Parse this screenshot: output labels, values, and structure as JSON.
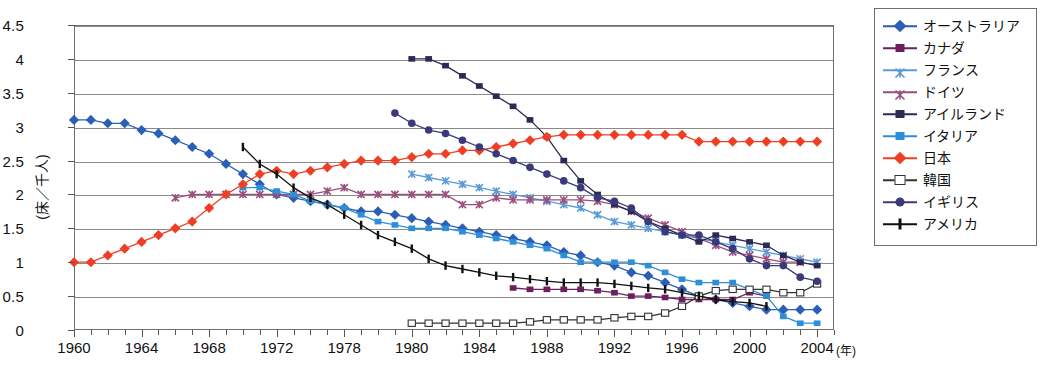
{
  "chart_data": {
    "type": "line",
    "title": "",
    "xlabel": "(年)",
    "ylabel": "(床／千人)",
    "xlim": [
      1960,
      2005
    ],
    "ylim": [
      0,
      4.5
    ],
    "ytick_values": [
      0,
      0.5,
      1,
      1.5,
      2,
      2.5,
      3,
      3.5,
      4,
      4.5
    ],
    "ytick_labels": [
      "0",
      "0.5",
      "1",
      "1.5",
      "2",
      "2.5",
      "3",
      "3.5",
      "4",
      "4.5"
    ],
    "xtick_values": [
      1960,
      1964,
      1968,
      1972,
      1976,
      1980,
      1984,
      1988,
      1992,
      1996,
      2000,
      2004
    ],
    "xtick_labels": [
      "1960",
      "1964",
      "1968",
      "1972",
      "1978",
      "1980",
      "1984",
      "1988",
      "1992",
      "1996",
      "2000",
      "2004"
    ],
    "grid": true,
    "legend_position": "right",
    "series": [
      {
        "name": "オーストラリア",
        "color": "#2a5fb5",
        "marker": "diamond",
        "x": [
          1960,
          1961,
          1962,
          1963,
          1964,
          1965,
          1966,
          1967,
          1968,
          1969,
          1970,
          1971,
          1972,
          1973,
          1974,
          1975,
          1976,
          1977,
          1978,
          1979,
          1980,
          1981,
          1982,
          1983,
          1984,
          1985,
          1986,
          1987,
          1988,
          1989,
          1990,
          1991,
          1992,
          1993,
          1994,
          1995,
          1996,
          1997,
          1998,
          1999,
          2000,
          2001,
          2002,
          2003,
          2004
        ],
        "y": [
          3.1,
          3.1,
          3.05,
          3.05,
          2.95,
          2.9,
          2.8,
          2.7,
          2.6,
          2.45,
          2.3,
          2.15,
          2.0,
          1.95,
          1.9,
          1.85,
          1.8,
          1.75,
          1.75,
          1.7,
          1.65,
          1.6,
          1.55,
          1.5,
          1.45,
          1.4,
          1.35,
          1.3,
          1.25,
          1.15,
          1.1,
          1.0,
          0.95,
          0.85,
          0.8,
          0.7,
          0.6,
          0.5,
          0.45,
          0.4,
          0.35,
          0.3,
          0.3,
          0.3,
          0.3
        ]
      },
      {
        "name": "カナダ",
        "color": "#6d2060",
        "marker": "square",
        "x": [
          1986,
          1987,
          1988,
          1989,
          1990,
          1991,
          1992,
          1993,
          1994,
          1995,
          1996,
          1997,
          1998,
          1999,
          2000,
          2001
        ],
        "y": [
          0.62,
          0.6,
          0.6,
          0.6,
          0.6,
          0.58,
          0.55,
          0.5,
          0.5,
          0.48,
          0.45,
          0.45,
          0.45,
          0.45,
          0.55,
          0.5
        ]
      },
      {
        "name": "フランス",
        "color": "#5b9bd5",
        "marker": "x",
        "x": [
          1980,
          1981,
          1982,
          1983,
          1984,
          1985,
          1986,
          1987,
          1988,
          1989,
          1990,
          1991,
          1992,
          1993,
          1994,
          1995,
          1996,
          1997,
          1998,
          1999,
          2000,
          2001,
          2002,
          2003,
          2004
        ],
        "y": [
          2.3,
          2.25,
          2.2,
          2.15,
          2.1,
          2.05,
          2.0,
          1.95,
          1.9,
          1.85,
          1.8,
          1.7,
          1.6,
          1.55,
          1.5,
          1.45,
          1.4,
          1.35,
          1.3,
          1.25,
          1.2,
          1.15,
          1.1,
          1.05,
          1.0
        ]
      },
      {
        "name": "ドイツ",
        "color": "#9b4f7c",
        "marker": "x",
        "x": [
          1966,
          1967,
          1968,
          1969,
          1970,
          1971,
          1972,
          1973,
          1974,
          1975,
          1976,
          1977,
          1978,
          1979,
          1980,
          1981,
          1982,
          1983,
          1984,
          1985,
          1986,
          1987,
          1988,
          1989,
          1990,
          1991,
          1992,
          1993,
          1994,
          1995,
          1996,
          1997,
          1998,
          1999,
          2000,
          2001,
          2002,
          2003
        ],
        "y": [
          1.95,
          2.0,
          2.0,
          2.0,
          2.0,
          2.0,
          2.0,
          2.0,
          2.0,
          2.05,
          2.1,
          2.0,
          2.0,
          2.0,
          2.0,
          2.0,
          2.0,
          1.85,
          1.85,
          1.95,
          1.92,
          1.92,
          1.92,
          1.92,
          1.92,
          1.9,
          1.85,
          1.75,
          1.65,
          1.55,
          1.45,
          1.35,
          1.25,
          1.15,
          1.1,
          1.05,
          1.0,
          1.0
        ]
      },
      {
        "name": "アイルランド",
        "color": "#2b2a55",
        "marker": "square",
        "x": [
          1980,
          1981,
          1982,
          1983,
          1984,
          1985,
          1986,
          1987,
          1988,
          1989,
          1990,
          1991,
          1992,
          1993,
          1994,
          1995,
          1996,
          1997,
          1998,
          1999,
          2000,
          2001,
          2002,
          2003,
          2004
        ],
        "y": [
          4.0,
          4.0,
          3.9,
          3.75,
          3.6,
          3.45,
          3.3,
          3.1,
          2.85,
          2.5,
          2.2,
          2.0,
          1.85,
          1.75,
          1.6,
          1.5,
          1.4,
          1.3,
          1.4,
          1.35,
          1.3,
          1.25,
          1.1,
          1.0,
          0.95
        ]
      },
      {
        "name": "イタリア",
        "color": "#2e8fd8",
        "marker": "square",
        "x": [
          1970,
          1971,
          1972,
          1973,
          1974,
          1975,
          1976,
          1977,
          1978,
          1979,
          1980,
          1981,
          1982,
          1983,
          1984,
          1985,
          1986,
          1987,
          1988,
          1989,
          1990,
          1991,
          1992,
          1993,
          1994,
          1995,
          1996,
          1997,
          1998,
          1999,
          2000,
          2001,
          2002,
          2003,
          2004
        ],
        "y": [
          2.1,
          2.1,
          2.05,
          2.0,
          1.9,
          1.85,
          1.8,
          1.7,
          1.6,
          1.55,
          1.5,
          1.5,
          1.5,
          1.45,
          1.4,
          1.35,
          1.3,
          1.25,
          1.2,
          1.1,
          1.0,
          1.0,
          1.0,
          1.0,
          0.95,
          0.85,
          0.75,
          0.7,
          0.7,
          0.7,
          0.6,
          0.5,
          0.2,
          0.1,
          0.1
        ]
      },
      {
        "name": "日本",
        "color": "#ef3e23",
        "marker": "diamond",
        "x": [
          1960,
          1961,
          1962,
          1963,
          1964,
          1965,
          1966,
          1967,
          1968,
          1969,
          1970,
          1971,
          1972,
          1973,
          1974,
          1975,
          1976,
          1977,
          1978,
          1979,
          1980,
          1981,
          1982,
          1983,
          1984,
          1985,
          1986,
          1987,
          1988,
          1989,
          1990,
          1991,
          1992,
          1993,
          1994,
          1995,
          1996,
          1997,
          1998,
          1999,
          2000,
          2001,
          2002,
          2003,
          2004
        ],
        "y": [
          1.0,
          1.0,
          1.1,
          1.2,
          1.3,
          1.4,
          1.5,
          1.6,
          1.8,
          2.0,
          2.15,
          2.3,
          2.35,
          2.3,
          2.35,
          2.4,
          2.45,
          2.5,
          2.5,
          2.5,
          2.55,
          2.6,
          2.6,
          2.65,
          2.65,
          2.7,
          2.75,
          2.8,
          2.85,
          2.88,
          2.88,
          2.88,
          2.88,
          2.88,
          2.88,
          2.88,
          2.88,
          2.78,
          2.78,
          2.78,
          2.78,
          2.78,
          2.78,
          2.78,
          2.78
        ]
      },
      {
        "name": "韓国",
        "color": "#333333",
        "marker": "osquare",
        "x": [
          1980,
          1981,
          1982,
          1983,
          1984,
          1985,
          1986,
          1987,
          1988,
          1989,
          1990,
          1991,
          1992,
          1993,
          1994,
          1995,
          1996,
          1997,
          1998,
          1999,
          2000,
          2001,
          2002,
          2003,
          2004
        ],
        "y": [
          0.1,
          0.1,
          0.1,
          0.1,
          0.1,
          0.1,
          0.1,
          0.12,
          0.15,
          0.15,
          0.15,
          0.15,
          0.18,
          0.2,
          0.2,
          0.25,
          0.35,
          0.5,
          0.58,
          0.6,
          0.6,
          0.6,
          0.55,
          0.55,
          0.68
        ]
      },
      {
        "name": "イギリス",
        "color": "#3a3a7a",
        "marker": "circle",
        "x": [
          1979,
          1980,
          1981,
          1982,
          1983,
          1984,
          1985,
          1986,
          1987,
          1988,
          1989,
          1990,
          1991,
          1992,
          1993,
          1994,
          1995,
          1996,
          1997,
          1998,
          1999,
          2000,
          2001,
          2002,
          2003,
          2004
        ],
        "y": [
          3.2,
          3.05,
          2.95,
          2.9,
          2.8,
          2.7,
          2.6,
          2.5,
          2.4,
          2.3,
          2.2,
          2.1,
          1.95,
          1.9,
          1.8,
          1.6,
          1.45,
          1.4,
          1.4,
          1.3,
          1.2,
          1.05,
          0.95,
          0.95,
          0.78,
          0.72
        ]
      },
      {
        "name": "アメリカ",
        "color": "#111111",
        "marker": "bar",
        "x": [
          1970,
          1971,
          1972,
          1973,
          1974,
          1975,
          1976,
          1977,
          1978,
          1979,
          1980,
          1981,
          1982,
          1983,
          1984,
          1985,
          1986,
          1987,
          1988,
          1989,
          1990,
          1991,
          1992,
          1993,
          1994,
          1995,
          1996,
          1997,
          1998,
          1999,
          2000,
          2001
        ],
        "y": [
          2.7,
          2.45,
          2.3,
          2.1,
          1.95,
          1.85,
          1.7,
          1.55,
          1.4,
          1.3,
          1.2,
          1.05,
          0.95,
          0.9,
          0.85,
          0.8,
          0.78,
          0.75,
          0.72,
          0.7,
          0.7,
          0.7,
          0.68,
          0.65,
          0.62,
          0.6,
          0.55,
          0.5,
          0.45,
          0.42,
          0.4,
          0.35
        ]
      }
    ]
  }
}
